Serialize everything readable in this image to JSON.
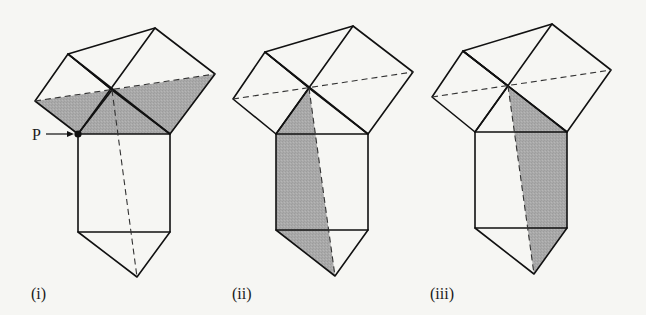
{
  "figure": {
    "shade_color": "#a9a9a9",
    "line_color": "#111111",
    "background": "#f6f6f3"
  },
  "panels": [
    {
      "label": "(i)",
      "point_label": "P",
      "shaded_region": "two leg squares below dashed diagonal + central right triangle"
    },
    {
      "label": "(ii)",
      "shaded_region": "left part of hypotenuse square and lower triangle, left of dashed line"
    },
    {
      "label": "(iii)",
      "shaded_region": "right part of hypotenuse square and lower triangle, right of dashed line"
    }
  ]
}
